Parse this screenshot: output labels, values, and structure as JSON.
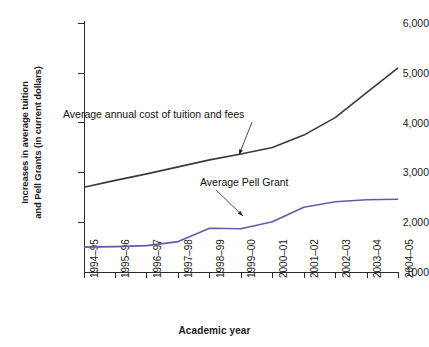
{
  "chart_data": {
    "type": "line",
    "title": "",
    "xlabel": "Academic year",
    "ylabel": "Increases in average tuition and Pell Grants (in current dollars)",
    "ylabel_line1": "Increases in average tuition",
    "ylabel_line2": "and Pell Grants (in current dollars)",
    "categories": [
      "1994–95",
      "1995–96",
      "1996–97",
      "1997–98",
      "1998–99",
      "1999–00",
      "2000–01",
      "2001–02",
      "2002–03",
      "2003–04",
      "2004–05"
    ],
    "ylim": [
      1000,
      6000
    ],
    "ytick_labels": [
      "6,000",
      "5,000",
      "4,000",
      "3,000",
      "2,000",
      "1000"
    ],
    "ytick_values": [
      6000,
      5000,
      4000,
      3000,
      2000,
      1000
    ],
    "grid": false,
    "legend": "none (direct annotations)",
    "series": [
      {
        "name": "Average annual cost of tuition and fees",
        "color": "#3a3a3a",
        "values": [
          2700,
          2840,
          2970,
          3110,
          3250,
          3370,
          3500,
          3750,
          4100,
          4600,
          5100
        ]
      },
      {
        "name": "Average Pell Grant",
        "color": "#5a5fa8",
        "values": [
          1500,
          1510,
          1530,
          1610,
          1880,
          1870,
          2010,
          2300,
          2410,
          2450,
          2460
        ]
      }
    ],
    "annotations": [
      {
        "text": "Average annual cost of tuition and fees",
        "target_series": "Average annual cost of tuition and fees"
      },
      {
        "text": "Average Pell Grant",
        "target_series": "Average Pell Grant"
      }
    ]
  }
}
